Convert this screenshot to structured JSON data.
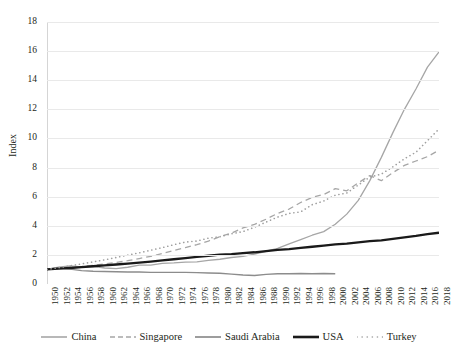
{
  "chart_data": {
    "type": "line",
    "title": "",
    "subtitle": "",
    "xlabel": "",
    "ylabel": "Index",
    "xlim": [
      1950,
      2018
    ],
    "ylim": [
      0,
      18
    ],
    "grid": true,
    "legend_position": "bottom",
    "y_ticks": [
      0,
      2,
      4,
      6,
      8,
      10,
      12,
      14,
      16,
      18
    ],
    "x": [
      1950,
      1952,
      1954,
      1956,
      1958,
      1960,
      1962,
      1964,
      1966,
      1968,
      1970,
      1972,
      1974,
      1976,
      1978,
      1980,
      1982,
      1984,
      1986,
      1988,
      1990,
      1992,
      1994,
      1996,
      1998,
      2000,
      2002,
      2004,
      2006,
      2008,
      2010,
      2012,
      2014,
      2016,
      2018
    ],
    "x_tick_labels": [
      "1950",
      "1952",
      "1954",
      "1956",
      "1958",
      "1960",
      "1962",
      "1964",
      "1966",
      "1968",
      "1970",
      "1972",
      "1974",
      "1976",
      "1978",
      "1980",
      "1982",
      "1984",
      "1986",
      "1988",
      "1990",
      "1992",
      "1994",
      "1996",
      "1998",
      "2000",
      "2002",
      "2004",
      "2006",
      "2008",
      "2010",
      "2012",
      "2014",
      "2016",
      "2018"
    ],
    "series": [
      {
        "name": "China",
        "color": "#a6a6a6",
        "style": "solid",
        "width": 1.3,
        "values": [
          1.0,
          1.15,
          1.25,
          1.18,
          1.22,
          1.1,
          1.05,
          1.15,
          1.3,
          1.3,
          1.42,
          1.45,
          1.5,
          1.52,
          1.62,
          1.7,
          1.82,
          1.9,
          2.05,
          2.25,
          2.45,
          2.75,
          3.05,
          3.35,
          3.6,
          4.1,
          4.8,
          5.75,
          7.1,
          8.7,
          10.4,
          12.0,
          13.4,
          14.9,
          15.95
        ]
      },
      {
        "name": "Singapore",
        "color": "#a6a6a6",
        "style": "dashed",
        "width": 1.3,
        "values": [
          1.0,
          1.05,
          1.12,
          1.2,
          1.28,
          1.38,
          1.48,
          1.6,
          1.75,
          1.9,
          2.1,
          2.3,
          2.5,
          2.7,
          2.95,
          3.25,
          3.5,
          3.85,
          4.1,
          4.45,
          4.85,
          5.15,
          5.6,
          5.95,
          6.15,
          6.55,
          6.4,
          6.95,
          7.45,
          7.1,
          7.65,
          8.15,
          8.45,
          8.75,
          9.2
        ]
      },
      {
        "name": "Saudi Arabia",
        "color": "#8c8c8c",
        "style": "solid",
        "width": 1.4,
        "values": [
          1.0,
          1.12,
          1.02,
          0.92,
          0.88,
          0.86,
          0.84,
          0.82,
          0.82,
          0.8,
          0.8,
          0.8,
          0.8,
          0.78,
          0.76,
          0.74,
          0.68,
          0.62,
          0.58,
          0.66,
          0.7,
          0.7,
          0.72,
          0.7,
          0.72,
          0.7,
          null,
          null,
          null,
          null,
          null,
          null,
          null,
          null,
          null
        ]
      },
      {
        "name": "USA",
        "color": "#1a1a1a",
        "style": "solid",
        "width": 2.3,
        "values": [
          1.0,
          1.05,
          1.1,
          1.16,
          1.22,
          1.28,
          1.34,
          1.4,
          1.47,
          1.54,
          1.62,
          1.7,
          1.78,
          1.86,
          1.94,
          2.02,
          2.05,
          2.12,
          2.18,
          2.26,
          2.34,
          2.4,
          2.48,
          2.56,
          2.64,
          2.72,
          2.78,
          2.86,
          2.94,
          3.0,
          3.1,
          3.2,
          3.3,
          3.42,
          3.52
        ]
      },
      {
        "name": "Turkey",
        "color": "#a0a0a0",
        "style": "dotted",
        "width": 1.6,
        "values": [
          1.0,
          1.12,
          1.25,
          1.38,
          1.52,
          1.66,
          1.82,
          1.98,
          2.14,
          2.32,
          2.5,
          2.7,
          2.88,
          2.95,
          3.15,
          3.25,
          3.45,
          3.6,
          3.9,
          4.25,
          4.6,
          4.85,
          4.95,
          5.45,
          5.7,
          6.1,
          6.25,
          6.8,
          7.35,
          7.55,
          8.05,
          8.6,
          9.05,
          9.85,
          10.65
        ]
      }
    ]
  },
  "legend": {
    "items": [
      {
        "label": "China",
        "swatch": "solid-light-line"
      },
      {
        "label": "Singapore",
        "swatch": "dashed-light-line"
      },
      {
        "label": "Saudi Arabia",
        "swatch": "solid-mid-line"
      },
      {
        "label": "USA",
        "swatch": "solid-thick-black-line"
      },
      {
        "label": "Turkey",
        "swatch": "dotted-light-line"
      }
    ]
  }
}
